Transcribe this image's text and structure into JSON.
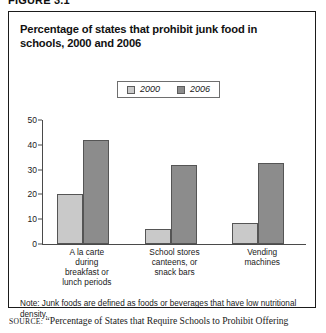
{
  "figure_label": "FIGURE 3.1",
  "title": "Percentage of states that prohibit junk food in schools, 2000 and 2006",
  "note": "Note: Junk foods are defined as foods or beverages that have low nutritional density.",
  "source_keyword": "SOURCE:",
  "source_text": "“Percentage of States that Require Schools to Prohibit Offering",
  "colors": {
    "series_2000": "#c9c9c9",
    "series_2006": "#8c8c8c",
    "bar_outline": "#555555",
    "axis": "#4a4a4a",
    "box_border": "#1b1b1b",
    "text": "#1a1a1a"
  },
  "chart_data": {
    "type": "bar",
    "title": "Percentage of states that prohibit junk food in schools, 2000 and 2006",
    "xlabel": "",
    "ylabel": "",
    "ylim": [
      0,
      50
    ],
    "yticks": [
      0,
      10,
      20,
      30,
      40,
      50
    ],
    "grid": false,
    "legend_position": "top-center",
    "categories": [
      "A la carte during breakfast or lunch periods",
      "School stores canteens, or snack bars",
      "Vending machines"
    ],
    "category_lines": [
      [
        "A la carte",
        "during",
        "breakfast or",
        "lunch periods"
      ],
      [
        "School stores",
        "canteens, or",
        "snack bars"
      ],
      [
        "Vending",
        "machines"
      ]
    ],
    "series": [
      {
        "name": "2000",
        "color": "#c9c9c9",
        "values": [
          20,
          6,
          8.5
        ]
      },
      {
        "name": "2006",
        "color": "#8c8c8c",
        "values": [
          42,
          32,
          32.5
        ]
      }
    ]
  }
}
